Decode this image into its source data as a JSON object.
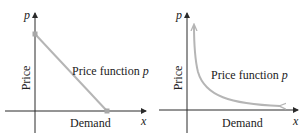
{
  "colors": {
    "axis": "#2a2a2a",
    "curve": "#b5b5b5",
    "point": "#a8a8a8",
    "text": "#222222"
  },
  "panels": [
    {
      "id": "linear",
      "y_axis_var": "p",
      "x_axis_var": "x",
      "y_axis_label": "Price",
      "x_axis_label": "Demand",
      "curve_label_text": "Price function ",
      "curve_label_var": "p",
      "curve_type": "line segment with endpoints"
    },
    {
      "id": "hyperbolic",
      "y_axis_var": "p",
      "x_axis_var": "x",
      "y_axis_label": "Price",
      "x_axis_label": "Demand",
      "curve_label_text": "Price function ",
      "curve_label_var": "p",
      "curve_type": "decreasing curve with arrows"
    }
  ]
}
